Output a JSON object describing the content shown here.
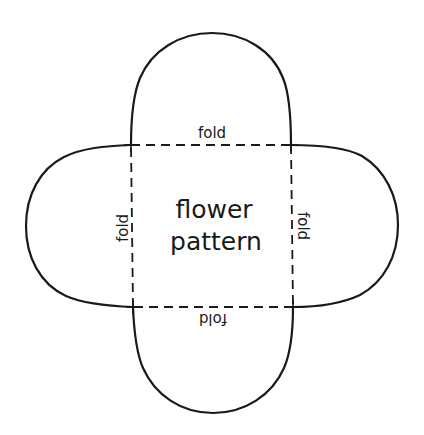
{
  "diagram": {
    "title": {
      "line1": "flower",
      "line2": "pattern"
    },
    "fold_labels": {
      "top": "fold",
      "left": "fold",
      "right": "fold",
      "bottom": "fold"
    },
    "colors": {
      "stroke": "#1a1a1a",
      "background": "#ffffff"
    },
    "shape": {
      "description": "Four rounded petals attached to the sides of a central dashed square",
      "petals": [
        "top",
        "right",
        "bottom",
        "left"
      ],
      "fold_line_style": "dashed"
    }
  }
}
